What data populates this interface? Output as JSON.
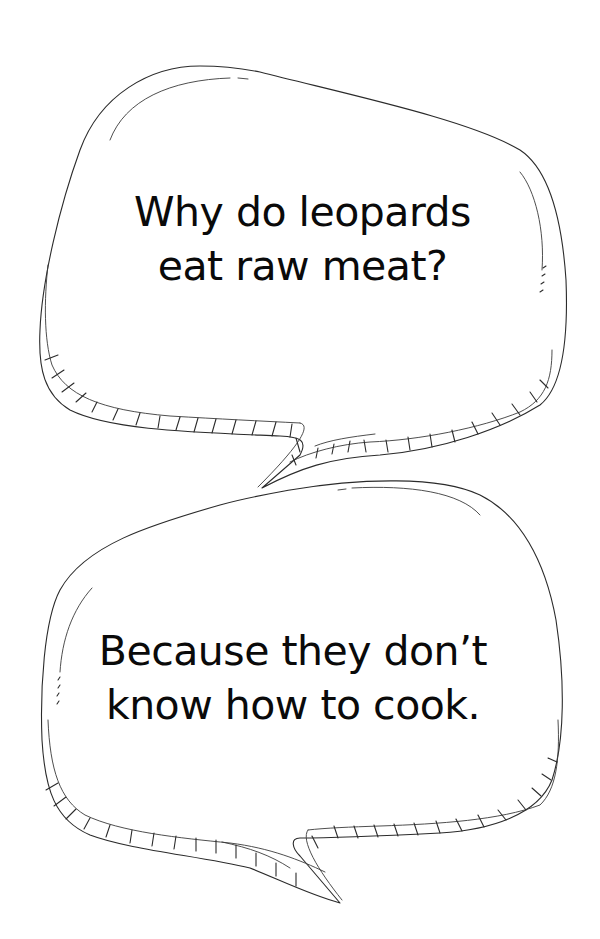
{
  "joke": {
    "question": {
      "lines": [
        "Why do leopards",
        "eat raw meat?"
      ]
    },
    "answer": {
      "lines": [
        "Because they don’t",
        "know how to cook."
      ]
    }
  },
  "style": {
    "background": "#ffffff",
    "ink": "#0a0a0a",
    "outline": "#2b2b2b"
  },
  "decorations": {
    "bubbles": [
      "speech-bubble-top",
      "speech-bubble-bottom"
    ],
    "icons": [
      "speech-bubble-icon",
      "speech-bubble-icon"
    ]
  }
}
